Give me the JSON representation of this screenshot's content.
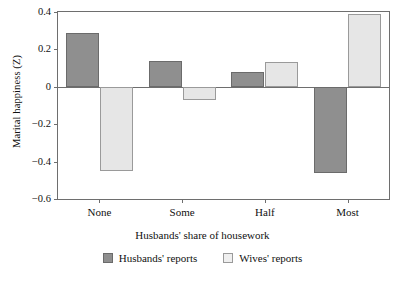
{
  "chart_data": {
    "type": "bar",
    "title": "",
    "xlabel": "Husbands' share of housework",
    "ylabel": "Marital happiness (Z)",
    "categories": [
      "None",
      "Some",
      "Half",
      "Most"
    ],
    "series": [
      {
        "name": "Husbands' reports",
        "values": [
          0.29,
          0.14,
          0.08,
          -0.46
        ],
        "color": "#8f8f8f"
      },
      {
        "name": "Wives' reports",
        "values": [
          -0.45,
          -0.07,
          0.13,
          0.39
        ],
        "color": "#e6e6e6"
      }
    ],
    "ylim": [
      -0.6,
      0.4
    ],
    "yticks": [
      0.4,
      0.2,
      0,
      -0.2,
      -0.4,
      -0.6
    ],
    "ytick_labels": [
      "0.4",
      "0.2",
      "0",
      "−0.2",
      "−0.4",
      "−0.6"
    ],
    "grid": false,
    "zero_line": true,
    "legend_position": "bottom"
  },
  "axes": {
    "y_title": "Marital happiness (Z)",
    "x_title": "Husbands' share of housework"
  },
  "legend": {
    "items": [
      {
        "label": "Husbands' reports",
        "swatch": "dark-gray-square"
      },
      {
        "label": "Wives' reports",
        "swatch": "light-gray-square"
      }
    ]
  },
  "colors": {
    "husbands": "#8f8f8f",
    "wives": "#e6e6e6",
    "axis": "#6e6e6e",
    "text": "#111111",
    "background": "#ffffff"
  }
}
